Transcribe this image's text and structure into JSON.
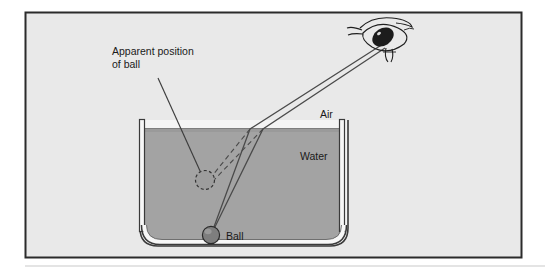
{
  "figure": {
    "frame": {
      "border_color": "#2b2b2b",
      "background_color": "#e9e9e9"
    },
    "labels": {
      "apparent_position_line1": "Apparent position",
      "apparent_position_line2": "of ball",
      "air": "Air",
      "water": "Water",
      "ball": "Ball"
    },
    "colors": {
      "water_fill": "#a3a3a3",
      "tank_wall": "#f2f2f2",
      "tank_outline": "#3a3a3a",
      "ball_fill": "#7e7e7e",
      "ball_outline": "#2f2f2f",
      "apparent_ball_fill": "#9a9a9a",
      "apparent_ball_outline": "#3a3a3a",
      "ray_color": "#4a4a4a",
      "dashed_ray_color": "#4a4a4a",
      "eye_color": "#1f1f1f",
      "text_color": "#1a1a1a"
    },
    "objects": {
      "ball": {
        "cx": 211,
        "cy": 235,
        "r": 9
      },
      "apparent_ball": {
        "cx": 205,
        "cy": 180,
        "r": 10
      },
      "eye": {
        "cx": 386,
        "cy": 38
      },
      "water_surface_y": 128,
      "tank": {
        "left": 140,
        "right": 348,
        "top": 120,
        "bottom": 245
      }
    },
    "rays": {
      "solid_ray_1": "Ball to refraction point A to eye",
      "solid_ray_2": "Ball to refraction point B to eye",
      "dashed_ray_1": "Refraction point A back to apparent ball",
      "dashed_ray_2": "Refraction point B back to apparent ball",
      "leader_line": "Apparent position label to apparent ball"
    }
  }
}
